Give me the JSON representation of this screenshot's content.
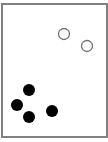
{
  "diagram": {
    "frame": {
      "x": 1,
      "y": 3,
      "width": 107,
      "height": 135,
      "border_color": "#808080"
    },
    "hollow_dots": [
      {
        "cx": 64,
        "cy": 34,
        "r": 5.5
      },
      {
        "cx": 87,
        "cy": 46,
        "r": 5.5
      }
    ],
    "filled_dots": [
      {
        "cx": 29,
        "cy": 90,
        "r": 6
      },
      {
        "cx": 17,
        "cy": 105,
        "r": 6
      },
      {
        "cx": 29,
        "cy": 117,
        "r": 6
      },
      {
        "cx": 52,
        "cy": 111,
        "r": 6
      }
    ],
    "colors": {
      "filled": "#000000",
      "hollow_stroke": "#707070"
    }
  }
}
